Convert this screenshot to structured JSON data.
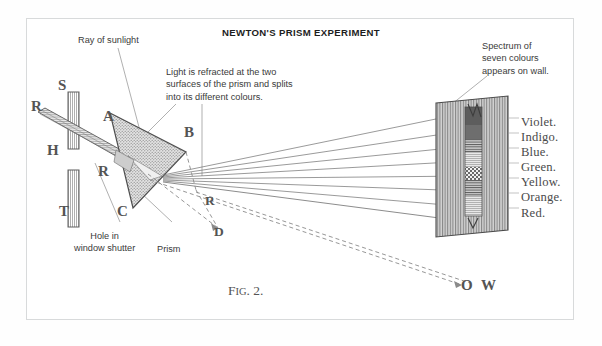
{
  "figure": {
    "title": "NEWTON'S PRISM EXPERIMENT",
    "caption_prefix": "F",
    "caption_smallcaps": "IG",
    "caption_suffix": ". 2."
  },
  "annotations": [
    {
      "name": "ray-of-sunlight",
      "text": "Ray of sunlight"
    },
    {
      "name": "refraction-note",
      "text": "Light is refracted at the two\nsurfaces of the prism and splits\ninto its different colours."
    },
    {
      "name": "spectrum-note",
      "text": "Spectrum of\nseven colours\nappears on wall."
    },
    {
      "name": "hole-note",
      "text": "Hole in\nwindow shutter"
    },
    {
      "name": "prism-note",
      "text": "Prism"
    }
  ],
  "point_labels": [
    {
      "name": "label-R-source",
      "text": "R"
    },
    {
      "name": "label-S",
      "text": "S"
    },
    {
      "name": "label-H",
      "text": "H"
    },
    {
      "name": "label-T",
      "text": "T"
    },
    {
      "name": "label-A",
      "text": "A"
    },
    {
      "name": "label-B",
      "text": "B"
    },
    {
      "name": "label-C",
      "text": "C"
    },
    {
      "name": "label-R-prism",
      "text": "R"
    },
    {
      "name": "label-R-mid",
      "text": "R"
    },
    {
      "name": "label-D",
      "text": "D"
    },
    {
      "name": "label-O",
      "text": "O"
    },
    {
      "name": "label-W",
      "text": "W"
    }
  ],
  "spectrum": {
    "colours": [
      "Violet.",
      "Indigo.",
      "Blue.",
      "Green.",
      "Yellow.",
      "Orange.",
      "Red."
    ]
  },
  "colors": {
    "ink": "#545454",
    "text": "#3a3a3a",
    "frame": "#d8dadb",
    "paper": "#ffffff",
    "prism_fill": "#b9b9b9",
    "wall_fill": "#9a9a9a"
  }
}
